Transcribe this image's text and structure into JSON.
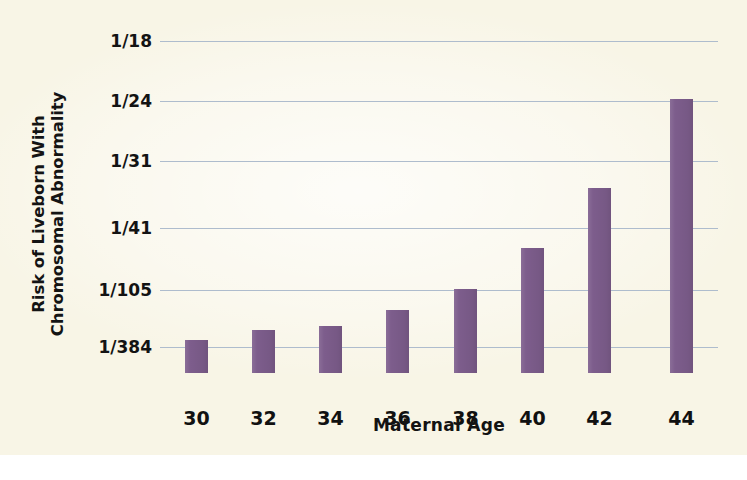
{
  "chart_data": {
    "type": "bar",
    "title": "",
    "xlabel": "Maternal Age",
    "ylabel_line1": "Risk of Liveborn With",
    "ylabel_line2": "Chromosomal Abnormality",
    "categories": [
      "30",
      "32",
      "34",
      "36",
      "38",
      "40",
      "42",
      "44"
    ],
    "values": [
      384,
      322,
      303,
      250,
      105,
      62,
      38,
      23
    ],
    "value_labels": [
      "1/384",
      "1/322",
      "1/303",
      "1/250",
      "1/105",
      "1/62",
      "1/38",
      "1/23"
    ],
    "ytick_labels": [
      "1/18",
      "1/24",
      "1/31",
      "1/41",
      "1/105",
      "1/384"
    ],
    "ytick_values": [
      18,
      24,
      31,
      41,
      105,
      384
    ],
    "ytick_pixel_y": [
      11,
      71,
      131,
      198,
      260,
      317
    ],
    "bar_pixel_top": [
      310,
      300,
      296,
      280,
      259,
      218,
      158,
      69
    ],
    "bar_pixel_left": [
      25,
      92,
      159,
      226,
      294,
      361,
      428,
      510
    ],
    "grid": true,
    "legend": false,
    "bar_color": "#7d5d8c",
    "gridline_color": "#aebccd",
    "background_color": "#f8f5e6",
    "text_color": "#131313"
  }
}
